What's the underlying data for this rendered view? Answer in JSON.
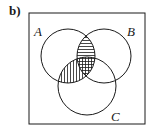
{
  "part_label": "b)",
  "diagram": {
    "type": "venn-3-set",
    "universal_set_box": true,
    "sets": [
      {
        "name": "A",
        "label": "A"
      },
      {
        "name": "B",
        "label": "B"
      },
      {
        "name": "C",
        "label": "C"
      }
    ],
    "shaded_regions": [
      {
        "region": "A ∩ B only (outside C)",
        "pattern": "horizontal-lines"
      },
      {
        "region": "A ∩ C only (outside B)",
        "pattern": "vertical-lines"
      },
      {
        "region": "A ∩ B ∩ C",
        "pattern": "grid (horizontal + vertical)"
      }
    ],
    "colors": {
      "stroke": "#1a1a1a",
      "background": "#ffffff"
    }
  }
}
